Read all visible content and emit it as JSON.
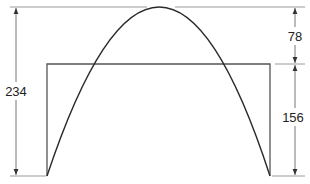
{
  "diagram": {
    "type": "dimensioned-figure",
    "colors": {
      "line": "#9a9a9a",
      "curve": "#2a2a2a",
      "text": "#222222",
      "background": "#ffffff"
    },
    "shapes": {
      "parabola": {
        "left_base_x": 47,
        "right_base_x": 270,
        "apex_x": 160,
        "apex_y": 7,
        "base_y": 176
      },
      "rectangle": {
        "left_x": 47,
        "right_x": 270,
        "top_y": 64,
        "bottom_y": 176
      }
    },
    "dimensions": {
      "total_height": {
        "label": "234",
        "side": "left"
      },
      "upper_height": {
        "label": "78",
        "side": "right"
      },
      "lower_height": {
        "label": "156",
        "side": "right"
      }
    }
  }
}
